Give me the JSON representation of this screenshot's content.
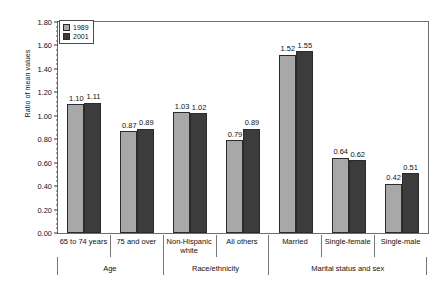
{
  "chart_data": {
    "type": "bar",
    "title": "",
    "xlabel": "",
    "ylabel": "Ratio of mean values",
    "ylim": [
      0.0,
      1.8
    ],
    "ytick_step": 0.2,
    "yticks": [
      "0.00",
      "0.20",
      "0.40",
      "0.60",
      "0.80",
      "1.00",
      "1.20",
      "1.40",
      "1.60",
      "1.80"
    ],
    "grid": false,
    "minor_ticks": true,
    "legend_position": "top-left",
    "categories": [
      "65 to 74 years",
      "75 and over",
      "Non-Hispanic white",
      "All others",
      "Married",
      "Single-female",
      "Single-male"
    ],
    "category_lines": [
      [
        "65 to 74 years"
      ],
      [
        "75 and over"
      ],
      [
        "Non-Hispanic",
        "white"
      ],
      [
        "All others"
      ],
      [
        "Married"
      ],
      [
        "Single-female"
      ],
      [
        "Single-male"
      ]
    ],
    "group_labels": [
      "Age",
      "Race/ethnicity",
      "Marital status and sex"
    ],
    "group_spans": [
      2,
      2,
      3
    ],
    "series": [
      {
        "name": "1989",
        "color": "#a8a8a8",
        "values": [
          1.1,
          0.87,
          1.03,
          0.79,
          1.52,
          0.64,
          0.42
        ]
      },
      {
        "name": "2001",
        "color": "#3c3c3c",
        "values": [
          1.11,
          0.89,
          1.02,
          0.89,
          1.55,
          0.62,
          0.51
        ]
      }
    ],
    "value_labels": [
      [
        "1.10",
        "1.11"
      ],
      [
        "0.87",
        "0.89"
      ],
      [
        "1.03",
        "1.02"
      ],
      [
        "0.79",
        "0.89"
      ],
      [
        "1.52",
        "1.55"
      ],
      [
        "0.64",
        "0.62"
      ],
      [
        "0.42",
        "0.51"
      ]
    ]
  },
  "legend": {
    "items": [
      {
        "label": "1989",
        "swatch": "legend-swatch-1989"
      },
      {
        "label": "2001",
        "swatch": "legend-swatch-2001"
      }
    ]
  }
}
